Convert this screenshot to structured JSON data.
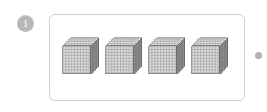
{
  "page": {
    "background_color": "#ffffff",
    "width": 267,
    "height": 112
  },
  "question": {
    "number": "1",
    "badge_color": "#b7b7b7",
    "badge_text_color": "#ffffff"
  },
  "panel": {
    "border_color": "#cfcfcf",
    "background_color": "#ffffff",
    "corner_radius": 6
  },
  "manipulatives": {
    "type": "base-ten-blocks",
    "unit_name": "thousand-cube",
    "unit_value": 1000,
    "count": 4,
    "total_value": 4000,
    "grid_divisions": 10,
    "front_face_color": "#d9d9d9",
    "top_face_color": "#e6e6e6",
    "side_face_color": "#8f8f8f",
    "grid_line_color": "#8a8a8a",
    "outline_color": "#6e6e6e",
    "items": [
      {
        "label": "thousand-cube-1",
        "value": 1000
      },
      {
        "label": "thousand-cube-2",
        "value": 1000
      },
      {
        "label": "thousand-cube-3",
        "value": 1000
      },
      {
        "label": "thousand-cube-4",
        "value": 1000
      }
    ]
  },
  "marker": {
    "name": "trailing-dot",
    "color": "#b0b0b0",
    "diameter": 7
  }
}
